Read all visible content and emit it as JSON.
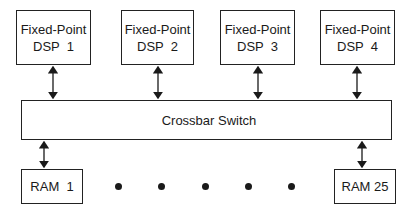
{
  "diagram": {
    "processors": [
      {
        "line1": "Fixed-Point",
        "line2": "DSP  1"
      },
      {
        "line1": "Fixed-Point",
        "line2": "DSP  2"
      },
      {
        "line1": "Fixed-Point",
        "line2": "DSP  3"
      },
      {
        "line1": "Fixed-Point",
        "line2": "DSP  4"
      }
    ],
    "switch": {
      "label": "Crossbar Switch"
    },
    "memories": [
      {
        "label": "RAM  1"
      },
      {
        "label": "RAM 25"
      }
    ],
    "ellipsis_dots": 5,
    "connections": "bidirectional arrows between each DSP and the crossbar switch, and between the crossbar switch and each RAM"
  }
}
